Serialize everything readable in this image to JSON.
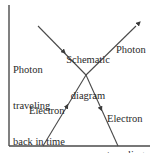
{
  "diagram": {
    "title": "Schematic diagram",
    "title_lines": [
      "Schematic",
      "diagram"
    ],
    "colors": {
      "line": "#4a4a4a",
      "text": "#2a2a2a",
      "background": "#ffffff"
    },
    "axes": {
      "vertical": {
        "x": 9,
        "y1": 5,
        "y2": 146
      },
      "horizontal": {
        "y": 146,
        "x1": 9,
        "x2": 150
      }
    },
    "vertex": {
      "x": 86,
      "y": 75
    },
    "lines": [
      {
        "id": "photon-back-in-time",
        "from": [
          38,
          26
        ],
        "to": [
          86,
          75
        ],
        "arrow": "down-right at midpoint"
      },
      {
        "id": "photon",
        "from": [
          86,
          75
        ],
        "to": [
          139,
          23
        ],
        "arrow": "up-right at end"
      },
      {
        "id": "electron",
        "from": [
          43,
          146
        ],
        "to": [
          86,
          75
        ],
        "arrow": "up-right at midpoint"
      },
      {
        "id": "electron-back-in-time",
        "from": [
          86,
          75
        ],
        "to": [
          118,
          146
        ],
        "arrow": "down-right at midpoint"
      }
    ],
    "labels": {
      "photon_back_in_time": [
        "Photon",
        "traveling",
        "back in time"
      ],
      "photon": "Photon",
      "electron": "Electron",
      "electron_back_in_time": [
        "Electron",
        "traveling",
        "back in time"
      ]
    }
  }
}
